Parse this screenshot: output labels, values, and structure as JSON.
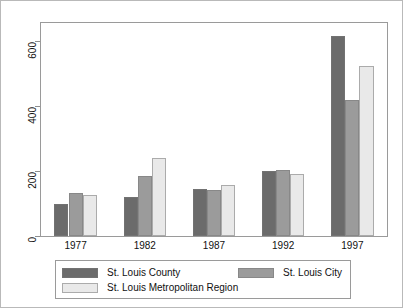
{
  "chart_data": {
    "type": "bar",
    "title": "",
    "subtitle": "",
    "xlabel": "",
    "ylabel": "",
    "categories": [
      "1977",
      "1982",
      "1987",
      "1992",
      "1997"
    ],
    "series": [
      {
        "name": "St. Louis County",
        "color": "#6b6b6b",
        "values": [
          100,
          120,
          145,
          203,
          620
        ]
      },
      {
        "name": "St. Louis City",
        "color": "#9b9b9b",
        "values": [
          133,
          186,
          143,
          204,
          420
        ]
      },
      {
        "name": "St. Louis Metropolitan Region",
        "color": "#e9e9e9",
        "values": [
          128,
          243,
          158,
          193,
          528
        ]
      }
    ],
    "ylim": [
      0,
      660
    ],
    "yticks": [
      0,
      200,
      400,
      600
    ],
    "ytick_labels": [
      "0",
      "200",
      "400",
      "600"
    ],
    "grid": false,
    "legend_position": "bottom",
    "y_tick_label_rotation": -90
  },
  "legend": {
    "entries": [
      {
        "label": "St. Louis County",
        "color": "#6b6b6b"
      },
      {
        "label": "St. Louis City",
        "color": "#9b9b9b"
      },
      {
        "label": "St. Louis Metropolitan Region",
        "color": "#e9e9e9"
      }
    ]
  },
  "colors": {
    "frame": "#9a9a9a",
    "outer_border": "#b9b9b9",
    "background": "#ffffff",
    "text": "#111111"
  }
}
